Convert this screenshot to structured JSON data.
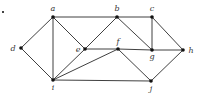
{
  "diagram": {
    "type": "undirected-graph",
    "nodes": [
      {
        "id": "a",
        "label": "a",
        "x": 53,
        "y": 17
      },
      {
        "id": "b",
        "label": "b",
        "x": 117,
        "y": 17
      },
      {
        "id": "c",
        "label": "c",
        "x": 152,
        "y": 17
      },
      {
        "id": "d",
        "label": "d",
        "x": 21,
        "y": 48
      },
      {
        "id": "e",
        "label": "e",
        "x": 85,
        "y": 49
      },
      {
        "id": "f",
        "label": "f",
        "x": 118,
        "y": 49
      },
      {
        "id": "g",
        "label": "g",
        "x": 152,
        "y": 50
      },
      {
        "id": "h",
        "label": "h",
        "x": 183,
        "y": 50
      },
      {
        "id": "i",
        "label": "i",
        "x": 53,
        "y": 80
      },
      {
        "id": "j",
        "label": "j",
        "x": 151,
        "y": 81
      }
    ],
    "edges": [
      [
        "a",
        "b"
      ],
      [
        "b",
        "c"
      ],
      [
        "a",
        "d"
      ],
      [
        "a",
        "e"
      ],
      [
        "a",
        "i"
      ],
      [
        "d",
        "i"
      ],
      [
        "e",
        "i"
      ],
      [
        "e",
        "b"
      ],
      [
        "e",
        "f"
      ],
      [
        "f",
        "g"
      ],
      [
        "g",
        "h"
      ],
      [
        "b",
        "g"
      ],
      [
        "c",
        "g"
      ],
      [
        "c",
        "h"
      ],
      [
        "f",
        "i"
      ],
      [
        "f",
        "j"
      ],
      [
        "i",
        "j"
      ],
      [
        "j",
        "h"
      ]
    ]
  }
}
